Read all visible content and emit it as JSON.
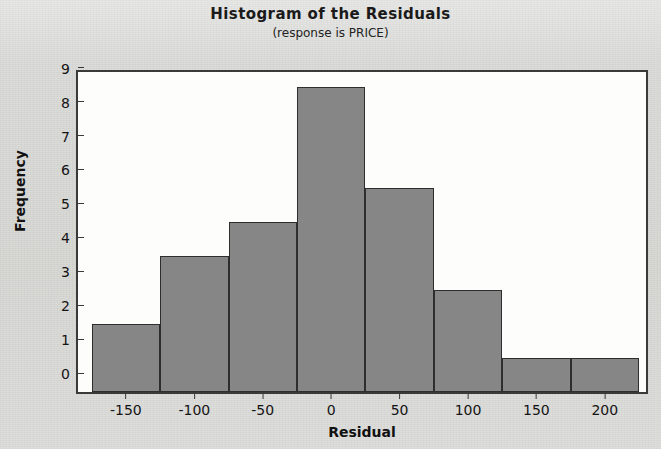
{
  "chart_data": {
    "type": "bar",
    "title": "Histogram of the Residuals",
    "subtitle": "(response is PRICE)",
    "xlabel": "Residual",
    "ylabel": "Frequency",
    "bin_width": 50,
    "bin_edges": [
      -175,
      -125,
      -75,
      -25,
      25,
      75,
      125,
      175,
      225
    ],
    "categories": [
      "-175 to -125",
      "-125 to -75",
      "-75 to -25",
      "-25 to 25",
      "25 to 75",
      "75 to 125",
      "125 to 175",
      "175 to 225"
    ],
    "bin_centers": [
      -150,
      -100,
      -50,
      0,
      50,
      100,
      150,
      200
    ],
    "values": [
      2,
      4,
      5,
      9,
      6,
      3,
      1,
      1
    ],
    "xlim": [
      -185,
      233
    ],
    "ylim": [
      0,
      9.55
    ],
    "xticks": [
      "-150",
      "-100",
      "-50",
      "0",
      "50",
      "100",
      "150",
      "200"
    ],
    "xtick_values": [
      -150,
      -100,
      -50,
      0,
      50,
      100,
      150,
      200
    ],
    "yticks": [
      "0",
      "1",
      "2",
      "3",
      "4",
      "5",
      "6",
      "7",
      "8",
      "9"
    ],
    "ytick_values": [
      0,
      1,
      2,
      3,
      4,
      5,
      6,
      7,
      8,
      9
    ],
    "grid": false,
    "legend": null,
    "bar_color": "#868686",
    "bar_edge_color": "#2e2e2e",
    "plot_background": "#fdfdfc",
    "figure_background": "#d8d8d6"
  }
}
